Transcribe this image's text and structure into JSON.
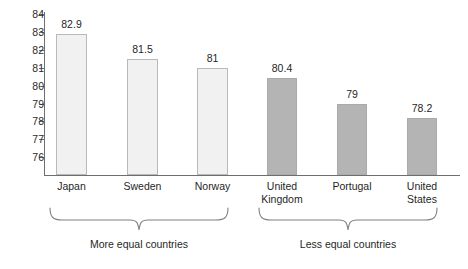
{
  "chart_data": {
    "type": "bar",
    "title": "",
    "subtitle": "",
    "xlabel": "",
    "ylabel": "",
    "ylim": [
      75.2,
      84
    ],
    "yticks": [
      84,
      83,
      82,
      81,
      80,
      79,
      78,
      77,
      76
    ],
    "ytick_labels": [
      "84",
      "83",
      "82",
      "81",
      "80",
      "79",
      "78",
      "77",
      "76"
    ],
    "grid": false,
    "legend": null,
    "categories": [
      "Japan",
      "Sweden",
      "Norway",
      "United Kingdom",
      "Portugal",
      "United States"
    ],
    "values": [
      82.9,
      81.5,
      81,
      80.4,
      79,
      78.2
    ],
    "value_labels": [
      "82.9",
      "81.5",
      "81",
      "80.4",
      "79",
      "78.2"
    ],
    "bar_colors": [
      "#f1f1f1",
      "#f1f1f1",
      "#f1f1f1",
      "#b4b4b4",
      "#b4b4b4",
      "#b4b4b4"
    ],
    "annotations": [
      {
        "label": "More equal countries",
        "covers": [
          "Japan",
          "Sweden",
          "Norway"
        ]
      },
      {
        "label": "Less equal countries",
        "covers": [
          "United Kingdom",
          "Portugal",
          "United States"
        ]
      }
    ]
  },
  "bars": [
    {
      "label_line1": "Japan",
      "label_line2": "",
      "value_label": "82.9",
      "value": 82.9,
      "tone": "light"
    },
    {
      "label_line1": "Sweden",
      "label_line2": "",
      "value_label": "81.5",
      "value": 81.5,
      "tone": "light"
    },
    {
      "label_line1": "Norway",
      "label_line2": "",
      "value_label": "81",
      "value": 81,
      "tone": "light"
    },
    {
      "label_line1": "United",
      "label_line2": "Kingdom",
      "value_label": "80.4",
      "value": 80.4,
      "tone": "dark"
    },
    {
      "label_line1": "Portugal",
      "label_line2": "",
      "value_label": "79",
      "value": 79,
      "tone": "dark"
    },
    {
      "label_line1": "United",
      "label_line2": "States",
      "value_label": "78.2",
      "value": 78.2,
      "tone": "dark"
    }
  ],
  "y_axis": {
    "ticks": [
      "84",
      "83",
      "82",
      "81",
      "80",
      "79",
      "78",
      "77",
      "76"
    ]
  },
  "groups": [
    {
      "caption": "More equal countries"
    },
    {
      "caption": "Less equal countries"
    }
  ],
  "colors": {
    "background": "#ffffff",
    "axis": "#6e6e6e",
    "text": "#1f1f1f",
    "bar_light_fill": "#f1f1f1",
    "bar_light_border": "#b9b9b9",
    "bar_dark_fill": "#b4b4b4",
    "brace": "#808080"
  }
}
